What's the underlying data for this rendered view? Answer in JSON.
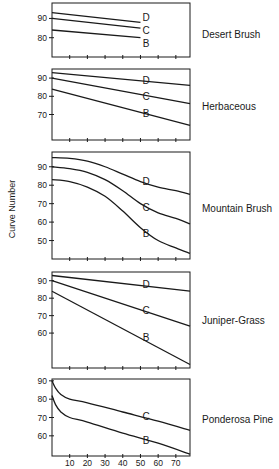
{
  "chart_data": {
    "type": "line",
    "title": "",
    "xlabel": "",
    "ylabel": "Curve Number",
    "x_ticks": [
      10,
      20,
      30,
      40,
      50,
      60,
      70
    ],
    "xlim": [
      0,
      78
    ],
    "panels": [
      {
        "name": "Desert Brush",
        "ylim": [
          70,
          98
        ],
        "y_ticks": [
          80,
          90
        ],
        "series": [
          {
            "name": "D",
            "x": [
              0,
              50
            ],
            "y": [
              93,
              88
            ]
          },
          {
            "name": "C",
            "x": [
              0,
              50
            ],
            "y": [
              90,
              85
            ]
          },
          {
            "name": "B",
            "x": [
              0,
              50
            ],
            "y": [
              84,
              80
            ]
          }
        ]
      },
      {
        "name": "Herbaceous",
        "ylim": [
          56,
          95
        ],
        "y_ticks": [
          70,
          80,
          90
        ],
        "series": [
          {
            "name": "D",
            "x": [
              0,
              78
            ],
            "y": [
              93,
              86
            ]
          },
          {
            "name": "C",
            "x": [
              0,
              78
            ],
            "y": [
              90,
              76
            ]
          },
          {
            "name": "B",
            "x": [
              0,
              78
            ],
            "y": [
              84,
              64
            ]
          }
        ]
      },
      {
        "name": "Mountain Brush",
        "ylim": [
          40,
          98
        ],
        "y_ticks": [
          50,
          60,
          70,
          80,
          90
        ],
        "series": [
          {
            "name": "D",
            "x": [
              0,
              10,
              20,
              30,
              40,
              50,
              60,
              70,
              78
            ],
            "y": [
              95,
              94.5,
              93,
              90,
              86,
              82,
              79,
              77,
              75
            ]
          },
          {
            "name": "C",
            "x": [
              0,
              10,
              20,
              30,
              40,
              50,
              60,
              70,
              78
            ],
            "y": [
              90,
              89,
              87,
              83,
              77,
              70,
              65,
              62,
              59
            ]
          },
          {
            "name": "B",
            "x": [
              0,
              10,
              20,
              30,
              40,
              50,
              60,
              70,
              78
            ],
            "y": [
              83,
              82,
              79,
              74,
              66,
              57,
              50,
              46,
              43
            ]
          }
        ]
      },
      {
        "name": "Juniper-Grass",
        "ylim": [
          40,
          95
        ],
        "y_ticks": [
          60,
          70,
          80,
          90
        ],
        "series": [
          {
            "name": "D",
            "x": [
              0,
              78
            ],
            "y": [
              93,
              84
            ]
          },
          {
            "name": "C",
            "x": [
              0,
              78
            ],
            "y": [
              90,
              64
            ]
          },
          {
            "name": "B",
            "x": [
              0,
              78
            ],
            "y": [
              84,
              42
            ]
          }
        ]
      },
      {
        "name": "Ponderosa Pine",
        "ylim": [
          49,
          91
        ],
        "y_ticks": [
          60,
          70,
          80,
          90
        ],
        "series": [
          {
            "name": "C",
            "x": [
              0,
              2,
              5,
              10,
              20,
              40,
              60,
              78
            ],
            "y": [
              90,
              86,
              82.5,
              80,
              78,
              73,
              68,
              63
            ]
          },
          {
            "name": "B",
            "x": [
              0,
              2,
              5,
              10,
              20,
              40,
              60,
              78
            ],
            "y": [
              82,
              77,
              73,
              70,
              67.5,
              61.5,
              56,
              50
            ]
          }
        ]
      }
    ]
  },
  "layout": {
    "plot_left": 52,
    "plot_right": 190,
    "panels_px": [
      {
        "top": 3,
        "bottom": 57,
        "label_y": 35,
        "curve_labels": [
          {
            "name": "D",
            "x": 146,
            "y": 17
          },
          {
            "name": "C",
            "x": 146,
            "y": 30
          },
          {
            "name": "B",
            "x": 146,
            "y": 43
          }
        ]
      },
      {
        "top": 69,
        "bottom": 140,
        "label_y": 107,
        "curve_labels": [
          {
            "name": "D",
            "x": 146,
            "y": 80
          },
          {
            "name": "C",
            "x": 146,
            "y": 96
          },
          {
            "name": "B",
            "x": 146,
            "y": 113
          }
        ]
      },
      {
        "top": 152,
        "bottom": 259,
        "label_y": 209,
        "curve_labels": [
          {
            "name": "D",
            "x": 146,
            "y": 181
          },
          {
            "name": "C",
            "x": 146,
            "y": 207
          },
          {
            "name": "B",
            "x": 146,
            "y": 233
          }
        ]
      },
      {
        "top": 272,
        "bottom": 368,
        "label_y": 321,
        "curve_labels": [
          {
            "name": "D",
            "x": 146,
            "y": 284
          },
          {
            "name": "C",
            "x": 146,
            "y": 310
          },
          {
            "name": "B",
            "x": 146,
            "y": 337
          }
        ]
      },
      {
        "top": 379,
        "bottom": 456,
        "label_y": 420,
        "curve_labels": [
          {
            "name": "C",
            "x": 146,
            "y": 416
          },
          {
            "name": "B",
            "x": 146,
            "y": 440
          }
        ]
      }
    ],
    "x_tick_label_y": 466,
    "line_color": "#1a1a1a"
  }
}
